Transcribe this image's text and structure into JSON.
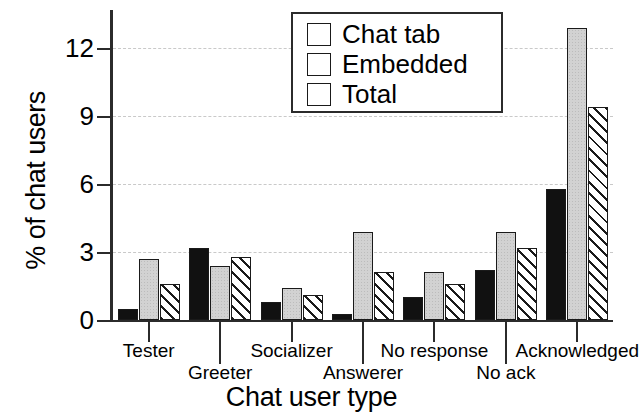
{
  "chart_data": {
    "type": "bar",
    "title": "",
    "xlabel": "Chat user type",
    "ylabel": "% of chat users",
    "categories": [
      "Tester",
      "Greeter",
      "Socializer",
      "Answerer",
      "No response",
      "No ack",
      "Acknowledged"
    ],
    "series": [
      {
        "name": "Chat tab",
        "values": [
          0.5,
          3.2,
          0.8,
          0.25,
          1.0,
          2.2,
          5.8
        ]
      },
      {
        "name": "Embedded",
        "values": [
          2.7,
          2.4,
          1.4,
          3.9,
          2.1,
          3.9,
          12.9
        ]
      },
      {
        "name": "Total",
        "values": [
          1.6,
          2.8,
          1.1,
          2.1,
          1.6,
          3.2,
          9.4
        ]
      }
    ],
    "ylim": [
      0,
      13.7
    ],
    "yticks": [
      0,
      3,
      6,
      9,
      12
    ],
    "ytick_labels": [
      "0",
      "3",
      "6",
      "9",
      "12"
    ],
    "grid": true,
    "grid_axis": "y",
    "grid_style": "dashed",
    "legend_position": "top-center",
    "series_styles": [
      "solid-black",
      "light-gray-stippled",
      "white-diagonal-hatch"
    ],
    "xlabel_rows": [
      0,
      1,
      0,
      1,
      0,
      1,
      0
    ]
  },
  "legend": {
    "items": [
      {
        "label": "Chat tab",
        "swatch": "solid-black-swatch"
      },
      {
        "label": "Embedded",
        "swatch": "light-gray-swatch"
      },
      {
        "label": "Total",
        "swatch": "hatched-swatch"
      }
    ]
  },
  "axes": {
    "y_title": "% of chat users",
    "x_title": "Chat user type"
  }
}
